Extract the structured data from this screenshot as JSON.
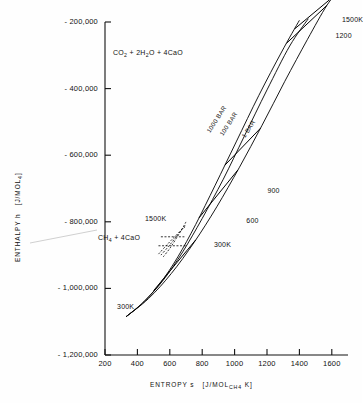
{
  "chart_data": {
    "type": "line",
    "title": "",
    "xlabel": "ENTROPY s  [J/MOL CH4 K]",
    "ylabel": "ENTHALPY h  [J/MOL CH4]",
    "xlim": [
      200,
      1700
    ],
    "ylim": [
      -1200000,
      -200000
    ],
    "grid": false,
    "legend_position": "none",
    "xticks": [
      200,
      400,
      600,
      800,
      1000,
      1200,
      1400,
      1600
    ],
    "yticks": [
      -200000,
      -400000,
      -600000,
      -800000,
      -1000000,
      -1200000
    ],
    "ytick_labels": [
      "- 200,000",
      "- 400,000",
      "- 600,000",
      "- 800,000",
      "- 1,000,000",
      "- 1,200,000"
    ],
    "xtick_labels": [
      "200",
      "400",
      "600",
      "800",
      "1000",
      "1200",
      "1400",
      "1600"
    ],
    "annotations": [
      {
        "name": "products-formula",
        "text": "CO2 + 2H2O + 4CaO",
        "x": 430,
        "y": -265000
      },
      {
        "name": "reactants-formula",
        "text": "CH4 + 4CaO",
        "x": 360,
        "y": -870000
      }
    ],
    "isobars": [
      {
        "name": "1000 BAR",
        "label": "1000 BAR",
        "s": [
          330,
          430,
          540,
          650,
          760,
          880,
          1010,
          1150,
          1290,
          1400
        ],
        "h": [
          -1085000,
          -1045000,
          -985000,
          -905000,
          -808000,
          -690000,
          -560000,
          -420000,
          -290000,
          -195000
        ]
      },
      {
        "name": "100 BAR",
        "label": "100 BAR",
        "s": [
          330,
          440,
          560,
          680,
          800,
          930,
          1060,
          1200,
          1340,
          1455
        ],
        "h": [
          -1085000,
          -1040000,
          -975000,
          -890000,
          -790000,
          -672000,
          -543000,
          -404000,
          -272000,
          -190000
        ]
      },
      {
        "name": "1 BAR",
        "label": "1 BAR",
        "s": [
          330,
          470,
          610,
          750,
          890,
          1030,
          1170,
          1310,
          1450,
          1570,
          1660
        ],
        "h": [
          -1085000,
          -1030000,
          -955000,
          -862000,
          -755000,
          -636000,
          -510000,
          -378000,
          -252000,
          -150000,
          -95000
        ]
      }
    ],
    "isotherms": [
      {
        "name": "300K",
        "label": "300K",
        "s_range": [
          500,
          760
        ],
        "h": -985000,
        "label_x": 860,
        "label_y": -872000
      },
      {
        "name": "600",
        "label": "600",
        "s_range": [
          780,
          1020
        ],
        "h": -795000,
        "label_x": 1060,
        "label_y": -800000
      },
      {
        "name": "900",
        "label": "900",
        "s_range": [
          940,
          1160
        ],
        "h": -718000,
        "label_x": 1190,
        "label_y": -712000
      },
      {
        "name": "1200",
        "label": "1200",
        "s_range": [
          1320,
          1570
        ],
        "h": -243000,
        "label_x": 1610,
        "label_y": -245000
      },
      {
        "name": "1500K",
        "label": "1500K",
        "s_range": [
          1370,
          1620
        ],
        "h": -205000,
        "label_x": 1650,
        "label_y": -198000
      }
    ],
    "lower_family": {
      "name": "CH4 + 4CaO reactant isotherms",
      "style": "dashed",
      "label_300K_x": 250,
      "label_300K_y": -1055000,
      "label_1500K_x": 620,
      "label_1500K_y": -793000,
      "label_1500K": "1500K",
      "label_300K": "300K"
    }
  },
  "labels": {
    "y_axis_title": "ENTHALPY  h",
    "y_axis_units_pre": "[J/MOL",
    "y_axis_units_sub": "CH4",
    "y_axis_units_post": "]",
    "x_axis_title": "ENTROPY  s",
    "x_axis_units_pre": "[J/MOL",
    "x_axis_units_sub": "CH4",
    "x_axis_units_post": "K]"
  },
  "colors": {
    "ink": "#111111",
    "background": "#fefefe",
    "curve": "#000000"
  }
}
